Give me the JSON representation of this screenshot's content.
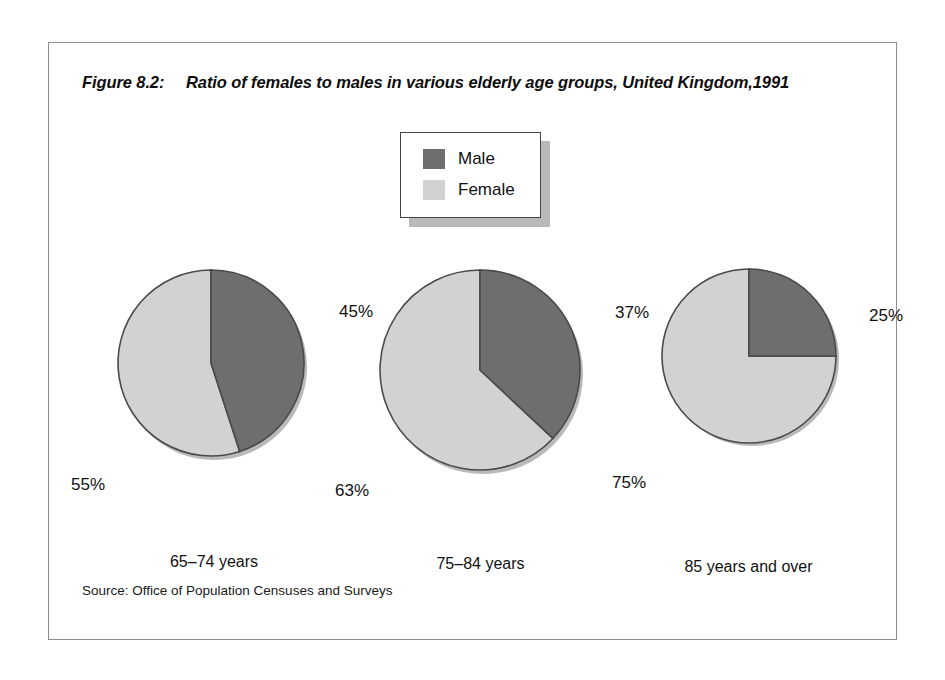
{
  "figure": {
    "number_label": "Figure 8.2:",
    "title": "Ratio of females to males in various elderly age groups, United Kingdom,1991",
    "source": "Source: Office of Population Censuses and Surveys"
  },
  "legend": {
    "entries": [
      {
        "label": "Male",
        "color": "#6e6e6e",
        "icon": "legend-swatch-male"
      },
      {
        "label": "Female",
        "color": "#d2d2d2",
        "icon": "legend-swatch-female"
      }
    ]
  },
  "colors": {
    "male": "#6e6e6e",
    "female": "#d2d2d2",
    "outline": "#4a4a4a",
    "shadow": "#b9b9b9",
    "frame": "#8d8d8d"
  },
  "chart_data": {
    "type": "pie",
    "title": "Ratio of females to males in various elderly age groups, United Kingdom,1991",
    "subtitle": "",
    "xlabel": "",
    "ylabel": "",
    "legend_position": "top-center",
    "grid": false,
    "series": [
      {
        "name": "Male",
        "color": "#6e6e6e",
        "values": [
          45,
          37,
          25
        ]
      },
      {
        "name": "Female",
        "color": "#d2d2d2",
        "values": [
          55,
          63,
          75
        ]
      }
    ],
    "categories": [
      "65–74 years",
      "75–84 years",
      "85 years and over"
    ],
    "charts": [
      {
        "category": "65–74 years",
        "slices": [
          {
            "name": "Male",
            "value": 45,
            "label": "45%",
            "color": "#6e6e6e"
          },
          {
            "name": "Female",
            "value": 55,
            "label": "55%",
            "color": "#d2d2d2"
          }
        ]
      },
      {
        "category": "75–84 years",
        "slices": [
          {
            "name": "Male",
            "value": 37,
            "label": "37%",
            "color": "#6e6e6e"
          },
          {
            "name": "Female",
            "value": 63,
            "label": "63%",
            "color": "#d2d2d2"
          }
        ]
      },
      {
        "category": "85 years and over",
        "slices": [
          {
            "name": "Male",
            "value": 25,
            "label": "25%",
            "color": "#6e6e6e"
          },
          {
            "name": "Female",
            "value": 75,
            "label": "75%",
            "color": "#d2d2d2"
          }
        ]
      }
    ],
    "units": "percent",
    "start_angle_deg": 0,
    "direction": "clockwise"
  }
}
